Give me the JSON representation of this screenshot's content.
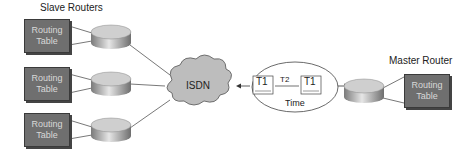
{
  "labels": {
    "slave_routers": "Slave Routers",
    "master_router": "Master Router",
    "isdn": "ISDN",
    "time": "Time",
    "t1_left": "T1",
    "t2": "T2",
    "t1_right": "T1"
  },
  "routing_tables": [
    {
      "line1": "Routing",
      "line2": "Table"
    },
    {
      "line1": "Routing",
      "line2": "Table"
    },
    {
      "line1": "Routing",
      "line2": "Table"
    },
    {
      "line1": "Routing",
      "line2": "Table"
    }
  ],
  "colors": {
    "table_fill": "#6f6f6f",
    "cloud_fill": "#bdbdbd",
    "router_fill": "#a8a8a8"
  }
}
